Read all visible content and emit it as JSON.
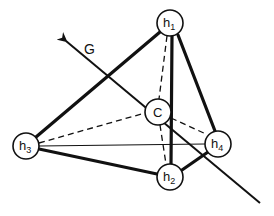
{
  "diagram": {
    "type": "tetrahedral geometry",
    "axis": {
      "label": "G",
      "tip": [
        62,
        38
      ],
      "end": [
        260,
        203
      ]
    },
    "nodes": {
      "h1": {
        "label": "h",
        "sub": "1",
        "x": 170,
        "y": 23
      },
      "h2": {
        "label": "h",
        "sub": "2",
        "x": 170,
        "y": 177
      },
      "h3": {
        "label": "h",
        "sub": "3",
        "x": 26,
        "y": 146
      },
      "h4": {
        "label": "h",
        "sub": "4",
        "x": 218,
        "y": 144
      },
      "C": {
        "label": "C",
        "sub": "",
        "x": 158,
        "y": 112
      }
    },
    "edges_thick": [
      [
        "h1",
        "h3"
      ],
      [
        "h1",
        "h2"
      ],
      [
        "h1",
        "h4"
      ],
      [
        "h3",
        "h2"
      ],
      [
        "h2",
        "h4"
      ]
    ],
    "edges_thin": [
      [
        "h3",
        "h4"
      ]
    ],
    "edges_dashed": [
      [
        "h1",
        "C"
      ],
      [
        "h3",
        "C"
      ],
      [
        "C",
        "h4"
      ],
      [
        "C",
        "h2"
      ]
    ],
    "node_radius": 13,
    "stroke_color": "#111111",
    "background": "#ffffff"
  }
}
